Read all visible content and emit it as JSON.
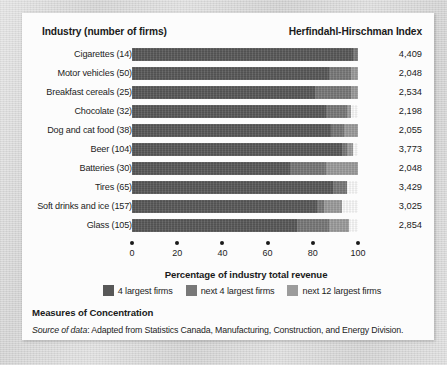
{
  "header": {
    "industry_label": "Industry (number of firms)",
    "hhi_label": "Herfindahl-Hirschman Index"
  },
  "caption": {
    "title": "Measures of Concentration",
    "source_prefix": "Source of data",
    "source_text": ": Adapted from Statistics Canada, Manufacturing, Construction, and Energy Division."
  },
  "colors": {
    "seg_a": "#585858",
    "seg_b": "#787878",
    "seg_c": "#9c9c9c",
    "panel": "#fcfcfc",
    "text": "#1d1d1d"
  },
  "chart_data": {
    "type": "bar",
    "orientation": "horizontal",
    "stacked": true,
    "title": "Measures of Concentration",
    "xlabel": "Percentage of industry total revenue",
    "ylabel": "Industry (number of firms)",
    "xlim": [
      0,
      100
    ],
    "xticks": [
      0,
      20,
      40,
      60,
      80,
      100
    ],
    "xticklabels": [
      "0",
      "20",
      "40",
      "60",
      "80",
      "100"
    ],
    "grid": false,
    "legend_position": "bottom-center",
    "legend": [
      "4 largest firms",
      "next 4 largest firms",
      "next 12 largest firms"
    ],
    "series": [
      {
        "name": "4 largest firms",
        "values": [
          98,
          87,
          81,
          86,
          88,
          93,
          70,
          89,
          82,
          73
        ]
      },
      {
        "name": "next 4 largest firms",
        "values": [
          2,
          10,
          16,
          9,
          6,
          2,
          16,
          6,
          3,
          14
        ]
      },
      {
        "name": "next 12 largest firms",
        "values": [
          0,
          3,
          3,
          2,
          6,
          3,
          14,
          0,
          8,
          9
        ]
      }
    ],
    "categories": [
      "Cigarettes (14)",
      "Motor vehicles (50)",
      "Breakfast cereals (25)",
      "Chocolate (32)",
      "Dog and cat food (38)",
      "Beer (104)",
      "Batteries (30)",
      "Tires (65)",
      "Soft drinks and ice (157)",
      "Glass (105)"
    ],
    "annotations_right_column": {
      "header": "Herfindahl-Hirschman Index",
      "values": [
        "4,409",
        "2,048",
        "2,534",
        "2,198",
        "2,055",
        "3,773",
        "2,048",
        "3,429",
        "3,025",
        "2,854"
      ]
    },
    "rows": [
      {
        "label": "Cigarettes (14)",
        "hhi": "4,409",
        "seg_a": 98,
        "seg_b": 2,
        "seg_c": 0
      },
      {
        "label": "Motor vehicles (50)",
        "hhi": "2,048",
        "seg_a": 87,
        "seg_b": 10,
        "seg_c": 3
      },
      {
        "label": "Breakfast cereals (25)",
        "hhi": "2,534",
        "seg_a": 81,
        "seg_b": 16,
        "seg_c": 3
      },
      {
        "label": "Chocolate (32)",
        "hhi": "2,198",
        "seg_a": 86,
        "seg_b": 9,
        "seg_c": 2
      },
      {
        "label": "Dog and cat food (38)",
        "hhi": "2,055",
        "seg_a": 88,
        "seg_b": 6,
        "seg_c": 6
      },
      {
        "label": "Beer (104)",
        "hhi": "3,773",
        "seg_a": 93,
        "seg_b": 2,
        "seg_c": 3
      },
      {
        "label": "Batteries (30)",
        "hhi": "2,048",
        "seg_a": 70,
        "seg_b": 16,
        "seg_c": 14
      },
      {
        "label": "Tires (65)",
        "hhi": "3,429",
        "seg_a": 89,
        "seg_b": 6,
        "seg_c": 0
      },
      {
        "label": "Soft drinks and ice (157)",
        "hhi": "3,025",
        "seg_a": 82,
        "seg_b": 3,
        "seg_c": 8
      },
      {
        "label": "Glass (105)",
        "hhi": "2,854",
        "seg_a": 73,
        "seg_b": 14,
        "seg_c": 9
      }
    ]
  }
}
